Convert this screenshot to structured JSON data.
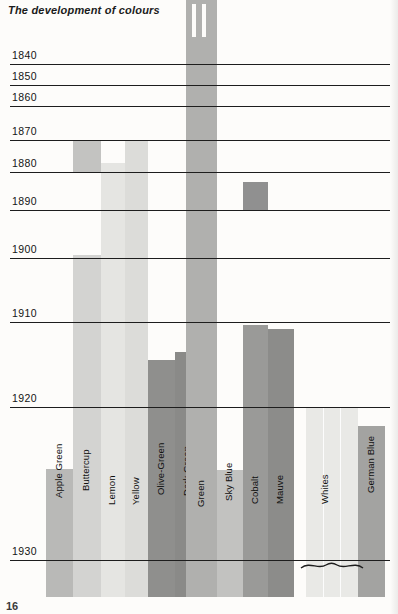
{
  "page": {
    "title": "The development of colours",
    "page_number": "16",
    "background": "#fdfcfa"
  },
  "chart_data": {
    "type": "bar",
    "title": "The development of colours",
    "xlabel": "",
    "ylabel": "",
    "orientation": "vertical-timeline",
    "axis_note": "Vertical axis is time (decade gridlines, 1840 at top to 1930 at bottom); bar tops mark the year each colour was introduced.",
    "ylim": [
      1833,
      1936
    ],
    "grid": true,
    "legend": "none",
    "tick_labels": [
      "1840",
      "1850",
      "1860",
      "1870",
      "1880",
      "1890",
      "1900",
      "1910",
      "1920",
      "1930"
    ],
    "tick_y_px": [
      64,
      85,
      106,
      140,
      172,
      210,
      258,
      322,
      407,
      560
    ],
    "categories": [
      "Apple Green",
      "Buttercup",
      "Lemon",
      "Yellow",
      "Olive-Green",
      "Dark Green",
      "Green",
      "Sky Blue",
      "Cobalt",
      "Mauve",
      "Whites",
      "German Blue"
    ],
    "values": [
      1921,
      1870,
      1877,
      1870,
      1913,
      1912,
      1835,
      1921,
      1909,
      1910,
      1920,
      1922
    ],
    "series": [
      {
        "name": "Introduction year (top of bar)",
        "values": [
          1921,
          1870,
          1877,
          1870,
          1913,
          1912,
          1835,
          1921,
          1909,
          1910,
          1920,
          1922
        ]
      }
    ],
    "annotations": [
      "Green column runs off the top of the chart and carries two white slots above 1840",
      "Buttercup shows a darker band between 1870 and 1880, then resumes at 1900",
      "Cobalt shows a darker band beginning around 1888",
      "A brace groups the Whites block below the 1930 line"
    ]
  },
  "bars": [
    {
      "name": "apple-green",
      "label": "Apple Green",
      "x": 46,
      "width": 27,
      "segments": [
        {
          "top": 469,
          "bottom": 597,
          "color": "#b9b9b7"
        }
      ],
      "label_top": 487,
      "color": "#b9b9b7"
    },
    {
      "name": "buttercup",
      "label": "Buttercup",
      "x": 73,
      "width": 28,
      "segments": [
        {
          "top": 141,
          "bottom": 172,
          "color": "#c3c3c1"
        },
        {
          "top": 255,
          "bottom": 597,
          "color": "#d3d3d1"
        }
      ],
      "label_top": 480,
      "color": "#d3d3d1"
    },
    {
      "name": "lemon",
      "label": "Lemon",
      "x": 101,
      "width": 24,
      "segments": [
        {
          "top": 163,
          "bottom": 597,
          "color": "#e5e5e2"
        }
      ],
      "label_top": 494,
      "color": "#e5e5e2"
    },
    {
      "name": "yellow",
      "label": "Yellow",
      "x": 125,
      "width": 23,
      "segments": [
        {
          "top": 140,
          "bottom": 597,
          "color": "#dcdcd9"
        }
      ],
      "label_top": 494,
      "color": "#dcdcd9"
    },
    {
      "name": "olive-green",
      "label": "Olive-Green",
      "x": 148,
      "width": 27,
      "segments": [
        {
          "top": 360,
          "bottom": 597,
          "color": "#8f8f8d"
        }
      ],
      "label_top": 484,
      "color": "#8f8f8d"
    },
    {
      "name": "dark-green",
      "label": "Dark Green",
      "x": 175,
      "width": 26,
      "segments": [
        {
          "top": 352,
          "bottom": 597,
          "color": "#8a8a88"
        }
      ],
      "label_top": 485,
      "color": "#8a8a88"
    },
    {
      "name": "green",
      "label": "Green",
      "x": 186,
      "width": 31,
      "segments": [
        {
          "top": 0,
          "bottom": 597,
          "color": "#b0b0ae"
        }
      ],
      "label_top": 496,
      "color": "#b0b0ae",
      "slots": [
        {
          "x": 6,
          "width": 4,
          "top": 4,
          "height": 33
        },
        {
          "x": 16,
          "width": 4,
          "top": 4,
          "height": 33
        }
      ]
    },
    {
      "name": "sky-blue",
      "label": "Sky Blue",
      "x": 217,
      "width": 26,
      "segments": [
        {
          "top": 470,
          "bottom": 597,
          "color": "#c2c2c0"
        }
      ],
      "label_top": 490,
      "color": "#c2c2c0"
    },
    {
      "name": "cobalt",
      "label": "Cobalt",
      "x": 243,
      "width": 25,
      "segments": [
        {
          "top": 182,
          "bottom": 210,
          "color": "#909090"
        },
        {
          "top": 325,
          "bottom": 597,
          "color": "#9a9a98"
        }
      ],
      "label_top": 493,
      "color": "#9a9a98"
    },
    {
      "name": "mauve",
      "label": "Mauve",
      "x": 268,
      "width": 26,
      "segments": [
        {
          "top": 329,
          "bottom": 597,
          "color": "#8c8c8a"
        }
      ],
      "label_top": 493,
      "color": "#8c8c8a"
    },
    {
      "name": "whites",
      "label": "Whites",
      "x": 306,
      "width": 52,
      "segments": [
        {
          "top": 407,
          "bottom": 597,
          "color": "#e9e9e6"
        }
      ],
      "label_top": 493,
      "label_offset_x": 20,
      "color": "#e9e9e6",
      "dividers": [
        17,
        34
      ]
    },
    {
      "name": "german-blue",
      "label": "German Blue",
      "x": 358,
      "width": 27,
      "segments": [
        {
          "top": 426,
          "bottom": 597,
          "color": "#a3a3a1"
        }
      ],
      "label_top": 482,
      "color": "#a3a3a1"
    }
  ],
  "gridlines": [
    {
      "year": "1840",
      "y": 64
    },
    {
      "year": "1850",
      "y": 85
    },
    {
      "year": "1860",
      "y": 106
    },
    {
      "year": "1870",
      "y": 140
    },
    {
      "year": "1880",
      "y": 172
    },
    {
      "year": "1890",
      "y": 210
    },
    {
      "year": "1900",
      "y": 258
    },
    {
      "year": "1910",
      "y": 322
    },
    {
      "year": "1920",
      "y": 407
    },
    {
      "year": "1930",
      "y": 560
    }
  ]
}
